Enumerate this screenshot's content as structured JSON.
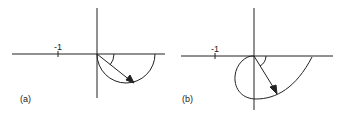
{
  "panels": [
    {
      "id": "a",
      "label": "(a)",
      "tick_label": "-1",
      "description": "Semicircular locus below the real axis starting at origin, with arrow from origin to the curve and angle arc"
    },
    {
      "id": "b",
      "label": "(b)",
      "tick_label": "-1",
      "description": "Loop locus extending into left half-plane below the real axis, with arrow from origin to the curve and angle arc"
    }
  ],
  "colors": {
    "stroke": "#222222",
    "background": "#ffffff"
  }
}
